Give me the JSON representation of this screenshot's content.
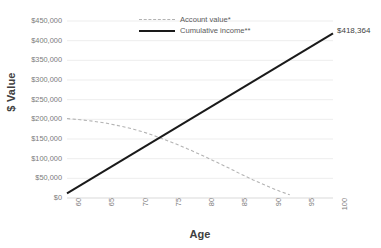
{
  "chart_data": {
    "type": "line",
    "title": "",
    "xlabel": "Age",
    "ylabel": "$ Value",
    "xlim": [
      60,
      100
    ],
    "ylim": [
      0,
      450000
    ],
    "grid": true,
    "legend_position": "top-center",
    "x_ticks": [
      "60",
      "65",
      "70",
      "75",
      "80",
      "85",
      "90",
      "95",
      "100"
    ],
    "y_ticks": [
      "$450,000",
      "$400,000",
      "$350,000",
      "$300,000",
      "$250,000",
      "$200,000",
      "$150,000",
      "$100,000",
      "$50,000",
      "$0"
    ],
    "y_tick_values": [
      450000,
      400000,
      350000,
      300000,
      250000,
      200000,
      150000,
      100000,
      50000,
      0
    ],
    "series": [
      {
        "name": "Account value*",
        "style": "dashed",
        "color": "#b3b3b3",
        "x": [
          60,
          62,
          64,
          66,
          68,
          70,
          72,
          74,
          76,
          78,
          80,
          82,
          84,
          86,
          88,
          90,
          92,
          93.5
        ],
        "values": [
          202000,
          199000,
          195000,
          190000,
          183000,
          175000,
          165000,
          153000,
          140000,
          126000,
          111000,
          95000,
          79000,
          62000,
          46000,
          31000,
          17000,
          8000
        ]
      },
      {
        "name": "Cumulative income**",
        "style": "solid",
        "color": "#1a1a1a",
        "x": [
          60,
          100
        ],
        "values": [
          12000,
          418364
        ]
      }
    ],
    "annotations": [
      {
        "text": "$418,364",
        "series": "Cumulative income**",
        "x": 100,
        "y": 418364
      }
    ]
  },
  "legend": {
    "items": [
      {
        "label": "Account value*",
        "style": "dashed"
      },
      {
        "label": "Cumulative income**",
        "style": "solid"
      }
    ]
  },
  "axes": {
    "x_title": "Age",
    "y_title": "$ Value"
  }
}
